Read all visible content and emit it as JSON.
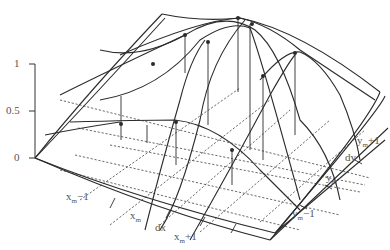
{
  "figure": {
    "type": "3d-wireframe-surface",
    "z_axis": {
      "ticks": [
        {
          "label": "1",
          "value": 1
        },
        {
          "label": "0.5",
          "value": 0.5
        },
        {
          "label": "0",
          "value": 0
        }
      ]
    },
    "x_axis": {
      "labels": {
        "xm_minus_1": {
          "base": "x",
          "sub": "m",
          "suffix": "−1"
        },
        "xm": {
          "base": "x",
          "sub": "m",
          "suffix": ""
        },
        "dx": {
          "text": "dx"
        },
        "xm_plus_1": {
          "base": "x",
          "sub": "m",
          "suffix": "+1"
        }
      }
    },
    "y_axis": {
      "labels": {
        "ym_plus_1": {
          "base": "y",
          "sub": "m",
          "suffix": "+1"
        },
        "dy": {
          "text": "dy"
        },
        "ym": {
          "base": "y",
          "sub": "m",
          "suffix": ""
        },
        "ym_minus_1": {
          "base": "y",
          "sub": "m",
          "suffix": "−1"
        }
      }
    },
    "colors": {
      "line": "#2b2b2b",
      "label": "#555555",
      "background": "#ffffff"
    }
  }
}
